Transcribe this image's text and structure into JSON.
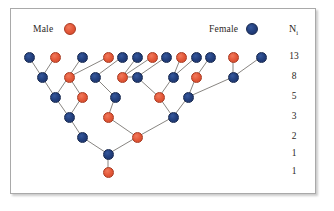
{
  "figure": {
    "type": "pedigree-tree",
    "legend": {
      "male": {
        "label": "Male",
        "color": "#e4593a",
        "marker": "circle"
      },
      "female": {
        "label": "Female",
        "color": "#23407e",
        "marker": "circle"
      }
    },
    "column_header": {
      "text": "N",
      "subscript": "i"
    },
    "row_counts": [
      "13",
      "8",
      "5",
      "3",
      "2",
      "1",
      "1"
    ]
  },
  "chart_data": {
    "type": "diagram-tree",
    "title": "",
    "legend_entries": [
      "Male",
      "Female"
    ],
    "ylabel": "N_i",
    "rows": [
      {
        "index": 1,
        "count": 13,
        "sexes": [
          "F",
          "M",
          "F",
          "M",
          "F",
          "F",
          "M",
          "F",
          "M",
          "F",
          "F",
          "M",
          "F"
        ]
      },
      {
        "index": 2,
        "count": 8,
        "sexes": [
          "F",
          "M",
          "F",
          "M",
          "F",
          "F",
          "M",
          "F"
        ]
      },
      {
        "index": 3,
        "count": 5,
        "sexes": [
          "F",
          "M",
          "F",
          "M",
          "F"
        ]
      },
      {
        "index": 4,
        "count": 3,
        "sexes": [
          "F",
          "M",
          "F"
        ]
      },
      {
        "index": 5,
        "count": 2,
        "sexes": [
          "F",
          "M"
        ]
      },
      {
        "index": 6,
        "count": 1,
        "sexes": [
          "F"
        ]
      },
      {
        "index": 7,
        "count": 1,
        "sexes": [
          "M"
        ]
      }
    ],
    "row_labels": [
      "13",
      "8",
      "5",
      "3",
      "2",
      "1",
      "1"
    ],
    "colors": {
      "male": "#e4593a",
      "female": "#23407e",
      "edge": "#7b7773"
    }
  }
}
